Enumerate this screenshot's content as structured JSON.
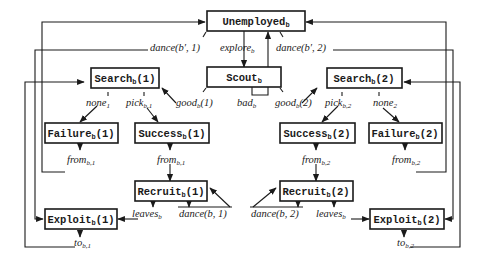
{
  "diagram": {
    "type": "state-transition",
    "colors": {
      "line": "#1a1a1a",
      "background": "#ffffff"
    },
    "nodes": {
      "unemployed": {
        "base": "Unemployed",
        "sub": "b",
        "suffix": ""
      },
      "scout": {
        "base": "Scout",
        "sub": "b",
        "suffix": ""
      },
      "search1": {
        "base": "Search",
        "sub": "b",
        "suffix": "(1)"
      },
      "search2": {
        "base": "Search",
        "sub": "b",
        "suffix": "(2)"
      },
      "failure1": {
        "base": "Failure",
        "sub": "b",
        "suffix": "(1)"
      },
      "success1": {
        "base": "Success",
        "sub": "b",
        "suffix": "(1)"
      },
      "success2": {
        "base": "Success",
        "sub": "b",
        "suffix": "(2)"
      },
      "failure2": {
        "base": "Failure",
        "sub": "b",
        "suffix": "(2)"
      },
      "recruit1": {
        "base": "Recruit",
        "sub": "b",
        "suffix": "(1)"
      },
      "recruit2": {
        "base": "Recruit",
        "sub": "b",
        "suffix": "(2)"
      },
      "exploit1": {
        "base": "Exploit",
        "sub": "b",
        "suffix": "(1)"
      },
      "exploit2": {
        "base": "Exploit",
        "sub": "b",
        "suffix": "(2)"
      }
    },
    "labels": {
      "dance_bp_1": {
        "base": "dance(b′, 1)",
        "sub": ""
      },
      "explore": {
        "base": "explore",
        "sub": "b"
      },
      "dance_bp_2": {
        "base": "dance(b′, 2)",
        "sub": ""
      },
      "none1": {
        "base": "none",
        "sub": "1"
      },
      "pick1": {
        "base": "pick",
        "sub": "b,1"
      },
      "good1": {
        "base": "good",
        "sub": "b",
        "suffix": "(1)"
      },
      "bad": {
        "base": "bad",
        "sub": "b"
      },
      "good2": {
        "base": "good",
        "sub": "b",
        "suffix": "(2)"
      },
      "pick2": {
        "base": "pick",
        "sub": "b,2"
      },
      "none2": {
        "base": "none",
        "sub": "2"
      },
      "from_b1_fail": {
        "base": "from",
        "sub": "b,1"
      },
      "from_b1_succ": {
        "base": "from",
        "sub": "b,1"
      },
      "from_b2_succ": {
        "base": "from",
        "sub": "b,2"
      },
      "from_b2_fail": {
        "base": "from",
        "sub": "b,2"
      },
      "leaves1": {
        "base": "leaves",
        "sub": "b"
      },
      "dance_b_1": {
        "base": "dance(b, 1)",
        "sub": ""
      },
      "dance_b_2": {
        "base": "dance(b, 2)",
        "sub": ""
      },
      "leaves2": {
        "base": "leaves",
        "sub": "b"
      },
      "to_b1": {
        "base": "to",
        "sub": "b,1"
      },
      "to_b2": {
        "base": "to",
        "sub": "b,2"
      }
    },
    "edges": [
      {
        "from": "Unemployed_b",
        "to": "Scout_b",
        "label": "explore_b"
      },
      {
        "from": "Scout_b",
        "to": "Unemployed_b",
        "label": "bad_b"
      },
      {
        "from": "Scout_b",
        "to": "Search_b(1)",
        "label": "good_b(1)"
      },
      {
        "from": "Scout_b",
        "to": "Search_b(2)",
        "label": "good_b(2)"
      },
      {
        "from": "Search_b(1)",
        "to": "Failure_b(1)",
        "label": "none_1"
      },
      {
        "from": "Search_b(1)",
        "to": "Success_b(1)",
        "label": "pick_b,1"
      },
      {
        "from": "Search_b(2)",
        "to": "Success_b(2)",
        "label": "pick_b,2"
      },
      {
        "from": "Search_b(2)",
        "to": "Failure_b(2)",
        "label": "none_2"
      },
      {
        "from": "Failure_b(1)",
        "to": "Unemployed_b",
        "label": "from_b,1"
      },
      {
        "from": "Success_b(1)",
        "to": "Recruit_b(1)",
        "label": "from_b,1"
      },
      {
        "from": "Success_b(2)",
        "to": "Recruit_b(2)",
        "label": "from_b,2"
      },
      {
        "from": "Failure_b(2)",
        "to": "Unemployed_b",
        "label": "from_b,2"
      },
      {
        "from": "Recruit_b(1)",
        "to": "Exploit_b(1)",
        "label": "leaves_b"
      },
      {
        "from": "Recruit_b(1)",
        "to": "Recruit_b(1)",
        "label": "dance(b,1)"
      },
      {
        "from": "Recruit_b(2)",
        "to": "Recruit_b(2)",
        "label": "dance(b,2)"
      },
      {
        "from": "Recruit_b(2)",
        "to": "Exploit_b(2)",
        "label": "leaves_b"
      },
      {
        "from": "Unemployed_b",
        "to": "Exploit_b(1)",
        "label": "dance(b′,1)"
      },
      {
        "from": "Unemployed_b",
        "to": "Exploit_b(2)",
        "label": "dance(b′,2)"
      },
      {
        "from": "Exploit_b(1)",
        "to": "Search_b(1)",
        "label": "to_b,1"
      },
      {
        "from": "Exploit_b(2)",
        "to": "Search_b(2)",
        "label": "to_b,2"
      }
    ]
  }
}
